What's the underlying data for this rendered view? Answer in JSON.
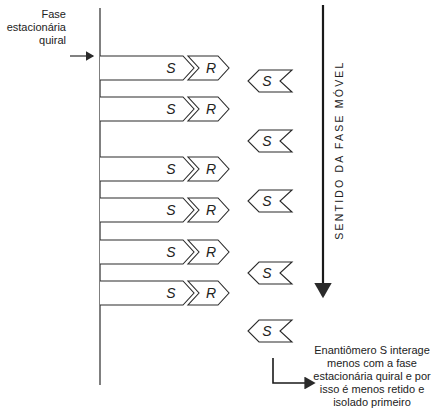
{
  "diagram": {
    "labels": {
      "stationary_phase": "Fase estacionária quiral",
      "mobile_phase_direction": "SENTIDO DA FASE MÓVEL",
      "s_enantiomer_note": "Enantiômero S interage menos com a fase estacionária quiral e por isso é menos retido e isolado primeiro"
    },
    "retained_pairs": {
      "count": 6,
      "left_symbol": "S",
      "right_symbol": "R",
      "rows_y": [
        56,
        97,
        157,
        198,
        240,
        281
      ]
    },
    "eluting_s": {
      "count": 5,
      "symbol": "S",
      "rows_y": [
        70,
        130,
        190,
        262,
        320
      ]
    },
    "colors": {
      "line": "#2a2a2a",
      "text": "#222222",
      "background": "#ffffff"
    }
  }
}
